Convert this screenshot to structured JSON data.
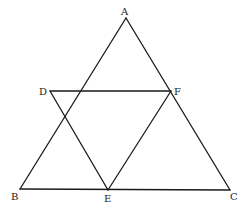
{
  "diagram": {
    "type": "geometry",
    "stroke_color": "#1a1a1a",
    "points": {
      "A": {
        "label": "A",
        "x": 126,
        "y": 18,
        "lx": 121,
        "ly": 15
      },
      "B": {
        "label": "B",
        "x": 20,
        "y": 189,
        "lx": 11,
        "ly": 200
      },
      "C": {
        "label": "C",
        "x": 230,
        "y": 190,
        "lx": 230,
        "ly": 200
      },
      "D": {
        "label": "D",
        "x": 50,
        "y": 91,
        "lx": 39,
        "ly": 95
      },
      "E": {
        "label": "E",
        "x": 108,
        "y": 190,
        "lx": 104,
        "ly": 202
      },
      "F": {
        "label": "F",
        "x": 171,
        "y": 91,
        "lx": 174,
        "ly": 95
      }
    },
    "segments": [
      [
        "A",
        "B"
      ],
      [
        "A",
        "C"
      ],
      [
        "B",
        "C"
      ],
      [
        "D",
        "F"
      ],
      [
        "D",
        "E"
      ],
      [
        "E",
        "F"
      ]
    ]
  }
}
